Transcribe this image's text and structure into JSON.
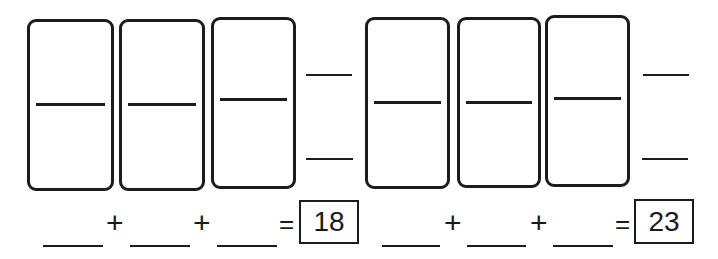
{
  "worksheet": {
    "groups": [
      {
        "dominoes": 3,
        "side_blanks": [
          "",
          ""
        ],
        "equation": {
          "addend_blanks": [
            "",
            "",
            ""
          ],
          "operators": [
            "+",
            "+"
          ],
          "equals": "=",
          "total": "18"
        }
      },
      {
        "dominoes": 3,
        "side_blanks": [
          "",
          ""
        ],
        "equation": {
          "addend_blanks": [
            "",
            "",
            ""
          ],
          "operators": [
            "+",
            "+"
          ],
          "equals": "=",
          "total": "23"
        }
      }
    ]
  }
}
